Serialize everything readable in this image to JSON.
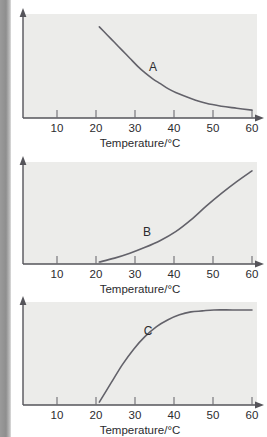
{
  "page": {
    "background_color": "#ffffff",
    "edge_strip_color": "#8e8e8e",
    "plot_background_color": "#ececea",
    "axis_color": "#55545a",
    "curve_color": "#63626a",
    "text_color": "#2b2b2e"
  },
  "chart_data": [
    {
      "type": "line",
      "id": "A",
      "curve_label": "A",
      "title": "",
      "xlabel": "Temperature/°C",
      "ylabel": "",
      "xlim": [
        0,
        60
      ],
      "ylim": [
        0,
        100
      ],
      "xticks": [
        10,
        20,
        30,
        40,
        50,
        60
      ],
      "xtick_labels": [
        "10",
        "20",
        "30",
        "40",
        "50",
        "60"
      ],
      "yticks": [],
      "ytick_labels": [],
      "grid": false,
      "legend": "none",
      "shape": "exponential-decay",
      "series": [
        {
          "name": "A",
          "x": [
            20,
            22,
            24,
            26,
            28,
            30,
            32,
            34,
            36,
            38,
            40,
            44,
            48,
            52,
            56,
            60
          ],
          "y": [
            93,
            85,
            77,
            69,
            61,
            53,
            46,
            40,
            35,
            30,
            26,
            20,
            15,
            12,
            10,
            8
          ]
        }
      ]
    },
    {
      "type": "line",
      "id": "B",
      "curve_label": "B",
      "title": "",
      "xlabel": "Temperature/°C",
      "ylabel": "",
      "xlim": [
        0,
        60
      ],
      "ylim": [
        0,
        100
      ],
      "xticks": [
        10,
        20,
        30,
        40,
        50,
        60
      ],
      "xtick_labels": [
        "10",
        "20",
        "30",
        "40",
        "50",
        "60"
      ],
      "yticks": [],
      "ytick_labels": [],
      "grid": false,
      "legend": "none",
      "shape": "exponential-growth",
      "series": [
        {
          "name": "B",
          "x": [
            20,
            24,
            28,
            32,
            36,
            40,
            44,
            48,
            52,
            56,
            60
          ],
          "y": [
            2,
            6,
            11,
            17,
            24,
            33,
            45,
            59,
            72,
            84,
            95
          ]
        }
      ]
    },
    {
      "type": "line",
      "id": "C",
      "curve_label": "C",
      "title": "",
      "xlabel": "Temperature/°C",
      "ylabel": "",
      "xlim": [
        0,
        60
      ],
      "ylim": [
        0,
        100
      ],
      "xticks": [
        10,
        20,
        30,
        40,
        50,
        60
      ],
      "xtick_labels": [
        "10",
        "20",
        "30",
        "40",
        "50",
        "60"
      ],
      "yticks": [],
      "ytick_labels": [],
      "grid": false,
      "legend": "none",
      "shape": "saturation-plateau",
      "series": [
        {
          "name": "C",
          "x": [
            20,
            23,
            26,
            29,
            32,
            35,
            38,
            41,
            44,
            47,
            50,
            55,
            60
          ],
          "y": [
            3,
            22,
            41,
            57,
            70,
            80,
            87,
            92,
            95,
            96,
            97,
            97,
            97
          ]
        }
      ]
    }
  ]
}
